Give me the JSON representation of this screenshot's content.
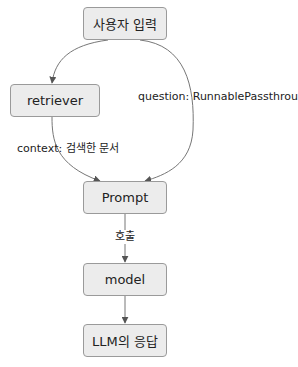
{
  "nodes": {
    "user_input": "사용자 입력",
    "retriever": "retriever",
    "prompt": "Prompt",
    "model": "model",
    "llm_response": "LLM의 응답"
  },
  "edges": {
    "user_to_retriever": "",
    "user_to_prompt": "question: RunnablePassthrough",
    "retriever_to_prompt": "context: 검색한 문서",
    "prompt_to_model": "호출",
    "model_to_llm": ""
  },
  "colors": {
    "node_fill": "#ececec",
    "node_border": "#9a9a9a",
    "edge": "#555555"
  }
}
